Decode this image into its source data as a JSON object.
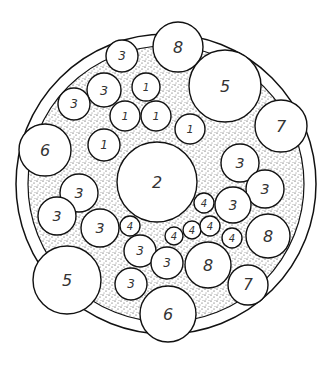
{
  "diagram": {
    "outer_ring": {
      "cx": 166,
      "cy": 184,
      "r": 150
    },
    "inner_ring": {
      "cx": 166,
      "cy": 184,
      "r": 138
    },
    "stipple_color": "#222222",
    "circles": [
      {
        "label": "8",
        "cx": 178,
        "cy": 47,
        "r": 25
      },
      {
        "label": "5",
        "cx": 225,
        "cy": 86,
        "r": 36
      },
      {
        "label": "7",
        "cx": 281,
        "cy": 126,
        "r": 26
      },
      {
        "label": "3",
        "cx": 122,
        "cy": 56,
        "r": 16
      },
      {
        "label": "3",
        "cx": 104,
        "cy": 90,
        "r": 17
      },
      {
        "label": "3",
        "cx": 74,
        "cy": 104,
        "r": 16
      },
      {
        "label": "1",
        "cx": 146,
        "cy": 87,
        "r": 14
      },
      {
        "label": "1",
        "cx": 125,
        "cy": 116,
        "r": 15
      },
      {
        "label": "1",
        "cx": 156,
        "cy": 116,
        "r": 15
      },
      {
        "label": "1",
        "cx": 190,
        "cy": 129,
        "r": 15
      },
      {
        "label": "1",
        "cx": 104,
        "cy": 145,
        "r": 16
      },
      {
        "label": "6",
        "cx": 45,
        "cy": 150,
        "r": 26
      },
      {
        "label": "2",
        "cx": 157,
        "cy": 182,
        "r": 40
      },
      {
        "label": "3",
        "cx": 240,
        "cy": 163,
        "r": 19
      },
      {
        "label": "3",
        "cx": 265,
        "cy": 189,
        "r": 19
      },
      {
        "label": "3",
        "cx": 233,
        "cy": 205,
        "r": 18
      },
      {
        "label": "8",
        "cx": 268,
        "cy": 236,
        "r": 22
      },
      {
        "label": "3",
        "cx": 79,
        "cy": 193,
        "r": 19
      },
      {
        "label": "3",
        "cx": 57,
        "cy": 216,
        "r": 19
      },
      {
        "label": "3",
        "cx": 100,
        "cy": 228,
        "r": 19
      },
      {
        "label": "4",
        "cx": 130,
        "cy": 226,
        "r": 10
      },
      {
        "label": "4",
        "cx": 204,
        "cy": 203,
        "r": 10
      },
      {
        "label": "4",
        "cx": 174,
        "cy": 236,
        "r": 9
      },
      {
        "label": "4",
        "cx": 192,
        "cy": 230,
        "r": 9
      },
      {
        "label": "4",
        "cx": 210,
        "cy": 226,
        "r": 10
      },
      {
        "label": "4",
        "cx": 232,
        "cy": 238,
        "r": 10
      },
      {
        "label": "8",
        "cx": 208,
        "cy": 265,
        "r": 23
      },
      {
        "label": "7",
        "cx": 248,
        "cy": 285,
        "r": 20
      },
      {
        "label": "5",
        "cx": 67,
        "cy": 280,
        "r": 34
      },
      {
        "label": "3",
        "cx": 140,
        "cy": 251,
        "r": 16
      },
      {
        "label": "3",
        "cx": 167,
        "cy": 263,
        "r": 16
      },
      {
        "label": "3",
        "cx": 131,
        "cy": 284,
        "r": 16
      },
      {
        "label": "6",
        "cx": 168,
        "cy": 314,
        "r": 28
      }
    ]
  }
}
